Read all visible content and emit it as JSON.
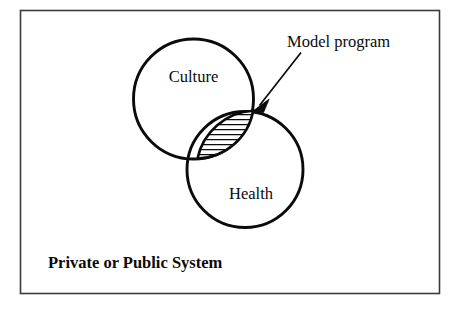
{
  "figure": {
    "type": "venn-diagram",
    "background_color": "#ffffff",
    "frame": {
      "border_color": "#3a3a3a",
      "fill_color": "#ffffff"
    },
    "sets": [
      {
        "id": "culture",
        "label": "Culture",
        "stroke_color": "#0b0b0b"
      },
      {
        "id": "health",
        "label": "Health",
        "stroke_color": "#0b0b0b"
      }
    ],
    "intersection": {
      "label": "Model program",
      "fill_pattern": "horizontal-hatching",
      "hatch_color": "#0b0b0b"
    },
    "callout": {
      "label": "Model program",
      "arrow_direction": "down-left",
      "arrow_color": "#0b0b0b"
    },
    "footer": {
      "label": "Private or Public System"
    }
  }
}
